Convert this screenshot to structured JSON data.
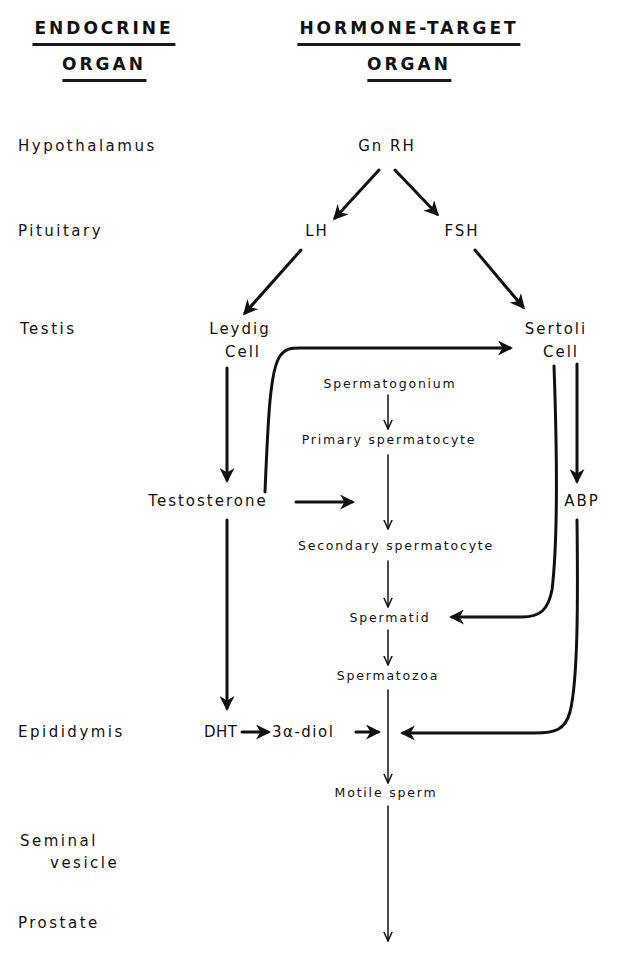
{
  "headers": {
    "left_line1": "ENDOCRINE",
    "left_line2": "ORGAN",
    "right_line1": "HORMONE-TARGET",
    "right_line2": "ORGAN"
  },
  "organs": [
    {
      "id": "hypothalamus",
      "label": "Hypothalamus"
    },
    {
      "id": "pituitary",
      "label": "Pituitary"
    },
    {
      "id": "testis",
      "label": "Testis"
    },
    {
      "id": "epididymis",
      "label": "Epididymis"
    },
    {
      "id": "seminal_vesicle",
      "label_line1": "Seminal",
      "label_line2": "vesicle"
    },
    {
      "id": "prostate",
      "label": "Prostate"
    }
  ],
  "nodes": {
    "gnrh": "Gn RH",
    "lh": "LH",
    "fsh": "FSH",
    "leydig_line1": "Leydig",
    "leydig_line2": "Cell",
    "sertoli_line1": "Sertoli",
    "sertoli_line2": "Cell",
    "spermatogonium": "Spermatogonium",
    "primary_spermatocyte": "Primary spermatocyte",
    "testosterone": "Testosterone",
    "abp": "ABP",
    "secondary_spermatocyte": "Secondary spermatocyte",
    "spermatid": "Spermatid",
    "spermatozoa": "Spermatozoa",
    "dht": "DHT",
    "diol": "3α-diol",
    "motile_sperm": "Motile sperm"
  },
  "edges": [
    {
      "from": "GnRH",
      "to": "LH"
    },
    {
      "from": "GnRH",
      "to": "FSH"
    },
    {
      "from": "LH",
      "to": "Leydig Cell"
    },
    {
      "from": "FSH",
      "to": "Sertoli Cell"
    },
    {
      "from": "Leydig Cell",
      "to": "Testosterone"
    },
    {
      "from": "Testosterone",
      "to": "Sertoli Cell"
    },
    {
      "from": "Testosterone",
      "to": "Spermatogenesis"
    },
    {
      "from": "Sertoli Cell",
      "to": "ABP"
    },
    {
      "from": "Sertoli Cell",
      "to": "Spermatid"
    },
    {
      "from": "Spermatogonium",
      "to": "Primary spermatocyte"
    },
    {
      "from": "Primary spermatocyte",
      "to": "Secondary spermatocyte"
    },
    {
      "from": "Secondary spermatocyte",
      "to": "Spermatid"
    },
    {
      "from": "Spermatid",
      "to": "Spermatozoa"
    },
    {
      "from": "Spermatozoa",
      "to": "Motile sperm"
    },
    {
      "from": "Testosterone",
      "to": "DHT"
    },
    {
      "from": "DHT",
      "to": "3α-diol"
    },
    {
      "from": "3α-diol",
      "to": "Sperm maturation"
    },
    {
      "from": "ABP",
      "to": "Sperm maturation"
    },
    {
      "from": "Motile sperm",
      "to": "Prostate"
    }
  ],
  "colors": {
    "ink": "#111111",
    "background": "#ffffff"
  }
}
